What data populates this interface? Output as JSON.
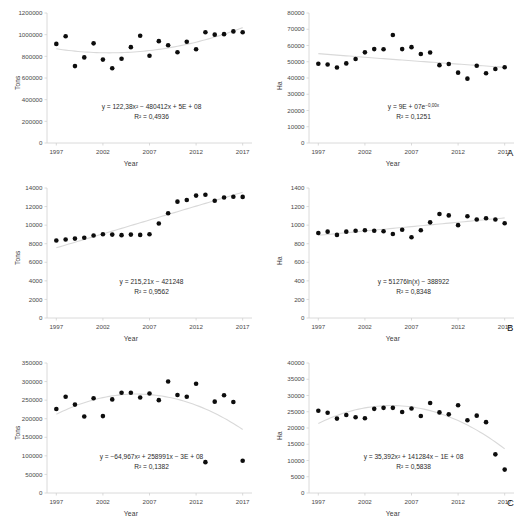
{
  "figure": {
    "panel_letters": [
      "A",
      "B",
      "C"
    ],
    "x_axis_title": "Year",
    "tick_years": [
      1997,
      2002,
      2007,
      2012,
      2017
    ]
  },
  "chart_data": [
    {
      "id": "a-left",
      "type": "scatter",
      "panel": "A",
      "position": "left",
      "title": "",
      "xlabel": "Year",
      "ylabel": "Tons",
      "xlim": [
        1996,
        2018
      ],
      "ylim": [
        0,
        1200000
      ],
      "xticks": [
        1997,
        2002,
        2007,
        2012,
        2017
      ],
      "yticks": [
        0,
        200000,
        400000,
        600000,
        800000,
        1000000,
        1200000
      ],
      "ytick_labels": [
        "0",
        "200000",
        "400000",
        "600000",
        "800000",
        "1000000",
        "1200000"
      ],
      "grid": false,
      "equation": "y = 122,38x² − 480412x + 5E + 08",
      "r_squared": "R² = 0,4936",
      "trendline_type": "polynomial",
      "x": [
        1997,
        1998,
        1999,
        2000,
        2001,
        2002,
        2003,
        2004,
        2005,
        2006,
        2007,
        2008,
        2009,
        2010,
        2011,
        2012,
        2013,
        2014,
        2015,
        2016,
        2017
      ],
      "values": [
        915000,
        985000,
        710000,
        790000,
        920000,
        770000,
        690000,
        778000,
        885000,
        990000,
        805000,
        940000,
        902000,
        838000,
        935000,
        865000,
        1022000,
        1000000,
        1005000,
        1030000,
        1022000
      ]
    },
    {
      "id": "a-right",
      "type": "scatter",
      "panel": "A",
      "position": "right",
      "title": "",
      "xlabel": "Year",
      "ylabel": "Ha",
      "xlim": [
        1996,
        2018
      ],
      "ylim": [
        0,
        80000
      ],
      "xticks": [
        1997,
        2002,
        2007,
        2012,
        2017
      ],
      "yticks": [
        0,
        10000,
        20000,
        30000,
        40000,
        50000,
        60000,
        70000,
        80000
      ],
      "ytick_labels": [
        "0",
        "10000",
        "20000",
        "30000",
        "40000",
        "50000",
        "60000",
        "70000",
        "80000"
      ],
      "grid": false,
      "equation": "y = 9E + 07e",
      "equation_exponent": "−0,00x",
      "r_squared": "R² = 0,1251",
      "trendline_type": "exponential",
      "x": [
        1997,
        1998,
        1999,
        2000,
        2001,
        2002,
        2003,
        2004,
        2005,
        2006,
        2007,
        2008,
        2009,
        2010,
        2011,
        2012,
        2013,
        2014,
        2015,
        2016,
        2017
      ],
      "values": [
        48800,
        48300,
        46500,
        49000,
        51700,
        55800,
        57800,
        57700,
        66500,
        57800,
        59000,
        54800,
        55700,
        47900,
        48600,
        43300,
        39600,
        47500,
        42900,
        45500,
        46600
      ]
    },
    {
      "id": "b-left",
      "type": "scatter",
      "panel": "B",
      "position": "left",
      "title": "",
      "xlabel": "Year",
      "ylabel": "Tons",
      "xlim": [
        1996,
        2018
      ],
      "ylim": [
        0,
        14000
      ],
      "xticks": [
        1997,
        2002,
        2007,
        2012,
        2017
      ],
      "yticks": [
        0,
        2000,
        4000,
        6000,
        8000,
        10000,
        12000,
        14000
      ],
      "ytick_labels": [
        "0",
        "2000",
        "4000",
        "6000",
        "8000",
        "10000",
        "12000",
        "14000"
      ],
      "grid": false,
      "equation": "y = 215,21x − 421248",
      "r_squared": "R² = 0,9562",
      "trendline_type": "linear",
      "x": [
        1997,
        1998,
        1999,
        2000,
        2001,
        2002,
        2003,
        2004,
        2005,
        2006,
        2007,
        2008,
        2009,
        2010,
        2011,
        2012,
        2013,
        2014,
        2015,
        2016,
        2017
      ],
      "values": [
        8350,
        8450,
        8550,
        8650,
        8880,
        9020,
        8980,
        8920,
        8980,
        8950,
        9020,
        10180,
        11280,
        12530,
        12700,
        13180,
        13280,
        12620,
        12980,
        13060,
        13040
      ]
    },
    {
      "id": "b-right",
      "type": "scatter",
      "panel": "B",
      "position": "right",
      "title": "",
      "xlabel": "Year",
      "ylabel": "Ha",
      "xlim": [
        1996,
        2018
      ],
      "ylim": [
        0,
        1400
      ],
      "xticks": [
        1997,
        2002,
        2007,
        2012,
        2017
      ],
      "yticks": [
        0,
        200,
        400,
        600,
        800,
        1000,
        1200,
        1400
      ],
      "ytick_labels": [
        "0",
        "200",
        "400",
        "600",
        "800",
        "1000",
        "1200",
        "1400"
      ],
      "grid": false,
      "equation": "y = 51276ln(x) − 388922",
      "r_squared": "R² = 0,8348",
      "trendline_type": "logarithmic",
      "x": [
        1997,
        1998,
        1999,
        2000,
        2001,
        2002,
        2003,
        2004,
        2005,
        2006,
        2007,
        2008,
        2009,
        2010,
        2011,
        2012,
        2013,
        2014,
        2015,
        2016,
        2017
      ],
      "values": [
        915,
        930,
        895,
        930,
        940,
        945,
        940,
        935,
        905,
        950,
        870,
        945,
        1030,
        1120,
        1105,
        1000,
        1095,
        1060,
        1075,
        1060,
        1020
      ]
    },
    {
      "id": "c-left",
      "type": "scatter",
      "panel": "C",
      "position": "left",
      "title": "",
      "xlabel": "Year",
      "ylabel": "Tons",
      "xlim": [
        1996,
        2018
      ],
      "ylim": [
        0,
        350000
      ],
      "xticks": [
        1997,
        2002,
        2007,
        2012,
        2017
      ],
      "yticks": [
        0,
        50000,
        100000,
        150000,
        200000,
        250000,
        300000,
        350000
      ],
      "ytick_labels": [
        "0",
        "50000",
        "100000",
        "150000",
        "200000",
        "250000",
        "300000",
        "350000"
      ],
      "grid": false,
      "equation": "y = −64,967x² + 258991x − 3E + 08",
      "r_squared": "R² = 0,1382",
      "trendline_type": "polynomial",
      "x": [
        1997,
        1998,
        1999,
        2000,
        2001,
        2002,
        2003,
        2004,
        2005,
        2006,
        2007,
        2008,
        2009,
        2010,
        2011,
        2012,
        2013,
        2014,
        2015,
        2016,
        2017
      ],
      "values": [
        226000,
        259000,
        238000,
        206000,
        255000,
        207000,
        252000,
        270000,
        270000,
        257000,
        268000,
        250000,
        300000,
        264000,
        259000,
        294000,
        83000,
        246000,
        263000,
        245000,
        87000
      ]
    },
    {
      "id": "c-right",
      "type": "scatter",
      "panel": "C",
      "position": "right",
      "title": "",
      "xlabel": "Year",
      "ylabel": "Ha",
      "xlim": [
        1996,
        2018
      ],
      "ylim": [
        0,
        40000
      ],
      "xticks": [
        1997,
        2002,
        2007,
        2012,
        2017
      ],
      "yticks": [
        0,
        5000,
        10000,
        15000,
        20000,
        25000,
        30000,
        35000,
        40000
      ],
      "ytick_labels": [
        "0",
        "5000",
        "10000",
        "15000",
        "20000",
        "25000",
        "30000",
        "35000",
        "40000"
      ],
      "grid": false,
      "equation": "y = 35,392x² + 141284x − 1E + 08",
      "r_squared": "R² = 0,5838",
      "trendline_type": "polynomial",
      "x": [
        1997,
        1998,
        1999,
        2000,
        2001,
        2002,
        2003,
        2004,
        2005,
        2006,
        2007,
        2008,
        2009,
        2010,
        2011,
        2012,
        2013,
        2014,
        2015,
        2016,
        2017
      ],
      "values": [
        25300,
        24700,
        22900,
        24000,
        23300,
        23000,
        25900,
        26200,
        26200,
        24900,
        26000,
        23700,
        27700,
        24800,
        24200,
        27000,
        22400,
        23800,
        21800,
        11900,
        7200
      ]
    }
  ]
}
